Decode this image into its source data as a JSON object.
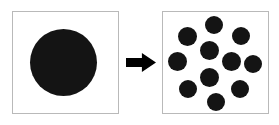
{
  "figure": {
    "width": 279,
    "height": 125,
    "background_color": "#ffffff",
    "blob_color": "#141414",
    "panel_border_color": "#b9b9b9",
    "arrow_color": "#000000"
  },
  "before_panel": {
    "name": "before-panel",
    "x": 12,
    "y": 11,
    "width": 107,
    "height": 103,
    "particles": [
      {
        "name": "large-particle",
        "cx": 63,
        "cy": 62,
        "d": 67
      }
    ]
  },
  "arrow": {
    "name": "transformation-arrow",
    "direction": "right",
    "x": 126,
    "y": 53,
    "width": 30,
    "height": 19
  },
  "after_panel": {
    "name": "after-panel",
    "x": 162,
    "y": 11,
    "width": 107,
    "height": 103,
    "particle_count": 11,
    "particles": [
      {
        "name": "particle-1",
        "cx": 214,
        "cy": 25,
        "d": 18
      },
      {
        "name": "particle-2",
        "cx": 187,
        "cy": 36,
        "d": 19
      },
      {
        "name": "particle-3",
        "cx": 241,
        "cy": 36,
        "d": 18
      },
      {
        "name": "particle-4",
        "cx": 209,
        "cy": 50,
        "d": 19
      },
      {
        "name": "particle-5",
        "cx": 177,
        "cy": 61,
        "d": 19
      },
      {
        "name": "particle-6",
        "cx": 231,
        "cy": 61,
        "d": 19
      },
      {
        "name": "particle-7",
        "cx": 253,
        "cy": 64,
        "d": 18
      },
      {
        "name": "particle-8",
        "cx": 209,
        "cy": 77,
        "d": 19
      },
      {
        "name": "particle-9",
        "cx": 188,
        "cy": 89,
        "d": 18
      },
      {
        "name": "particle-10",
        "cx": 240,
        "cy": 89,
        "d": 18
      },
      {
        "name": "particle-11",
        "cx": 216,
        "cy": 102,
        "d": 18
      }
    ]
  }
}
